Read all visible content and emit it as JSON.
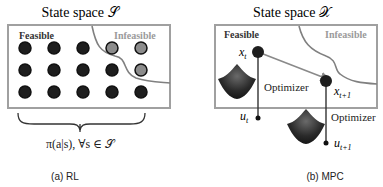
{
  "panel_a": {
    "title": "State space 𝒮",
    "feasible_label": "Feasible",
    "infeasible_label": "Infeasible",
    "policy_label": "π(a|s), ∀s ∈ 𝒮",
    "caption": "(a) RL",
    "grid": {
      "rows": 3,
      "cols": 5,
      "infeasible_points": [
        [
          0,
          3
        ],
        [
          0,
          4
        ],
        [
          1,
          4
        ]
      ]
    }
  },
  "panel_b": {
    "title": "State space 𝒳",
    "feasible_label": "Feasible",
    "infeasible_label": "Infeasible",
    "state_t": "x",
    "state_t_sub": "t",
    "state_t1": "x",
    "state_t1_sub": "t+1",
    "control_t": "u",
    "control_t_sub": "t",
    "control_t1": "u",
    "control_t1_sub": "t+1",
    "optimizer_1": "Optimizer",
    "optimizer_2": "Optimizer",
    "caption": "(b) MPC"
  },
  "colors": {
    "box_border": "#a0a0a0",
    "boundary": "#808080",
    "feasible_point": "#1e1e1e",
    "infeasible_point": "#8c8c8c",
    "infeasible_text": "#9a9a9a",
    "arrow": "#8a8a8a"
  }
}
